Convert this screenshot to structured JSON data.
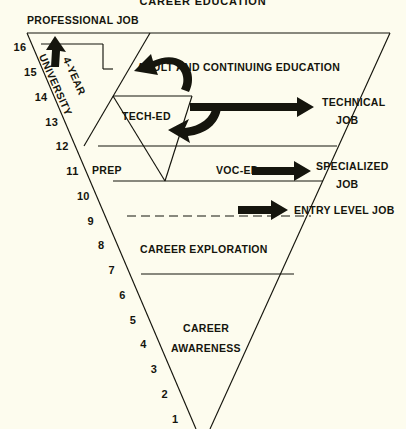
{
  "diagram": {
    "title": "CAREER EDUCATION",
    "background_color": "#fdfcee",
    "ink_color": "#15150d",
    "top_label": "PROFESSIONAL JOB",
    "bands": {
      "adult_continuing": "ADULT AND CONTINUING EDUCATION",
      "tech_ed": "TECH-ED",
      "prep": "PREP",
      "voc_ed": "VOC-ED",
      "career_exploration": "CAREER EXPLORATION",
      "career_awareness_line1": "CAREER",
      "career_awareness_line2": "AWARENESS"
    },
    "university_label_line1": "UNIVERSITY",
    "university_label_line2": "4-YEAR",
    "outcomes": [
      {
        "name": "technical-job",
        "line1": "TECHNICAL",
        "line2": "JOB"
      },
      {
        "name": "specialized-job",
        "line1": "SPECIALIZED",
        "line2": "JOB"
      },
      {
        "name": "entry-level-job",
        "line1": "ENTRY LEVEL JOB",
        "line2": ""
      }
    ],
    "scale_numbers": [
      "16",
      "15",
      "14",
      "13",
      "12",
      "11",
      "10",
      "9",
      "8",
      "7",
      "6",
      "5",
      "4",
      "3",
      "2",
      "1"
    ]
  }
}
